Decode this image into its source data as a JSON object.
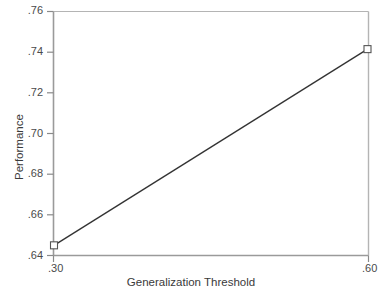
{
  "chart_data": {
    "type": "line",
    "title": "",
    "subtitle": "",
    "xlabel": "Generalization Threshold",
    "ylabel": "Performance",
    "x": [
      0.3,
      0.6
    ],
    "values": [
      0.645,
      0.7415
    ],
    "series": [
      {
        "name": "Performance",
        "x": [
          0.3,
          0.6
        ],
        "values": [
          0.645,
          0.7415
        ],
        "marker": "open-square",
        "line_color": "#333333"
      }
    ],
    "xlim": [
      0.3,
      0.6
    ],
    "ylim": [
      0.64,
      0.76
    ],
    "xticks": [
      0.3,
      0.6
    ],
    "xtick_labels": [
      ".30",
      ".60"
    ],
    "yticks": [
      0.64,
      0.66,
      0.68,
      0.7,
      0.72,
      0.74,
      0.76
    ],
    "ytick_labels": [
      ".64",
      ".66",
      ".68",
      ".70",
      ".72",
      ".74",
      ".76"
    ],
    "grid": false,
    "legend": null,
    "legend_position": "none",
    "annotations": []
  },
  "style": {
    "background": "#ffffff",
    "axis_color": "#9a9a9a",
    "tick_color": "#8a8a8a",
    "line_color": "#333333",
    "marker_edge_color": "#555555",
    "marker_face_color": "#ffffff",
    "text_color": "#3a3a3a"
  }
}
